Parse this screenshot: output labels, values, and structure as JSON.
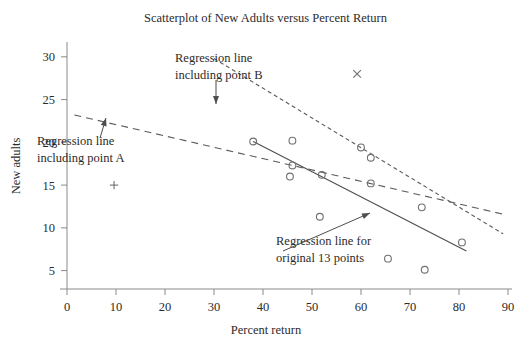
{
  "chart_data": {
    "type": "scatter",
    "title": "Scatterplot of New Adults versus Percent Return",
    "xlabel": "Percent return",
    "ylabel": "New adults",
    "xlim": [
      0,
      90
    ],
    "ylim": [
      3.2,
      31.5
    ],
    "xticks": [
      0,
      10,
      20,
      30,
      40,
      50,
      60,
      70,
      80,
      90
    ],
    "yticks": [
      5,
      10,
      15,
      20,
      25,
      30
    ],
    "grid": false,
    "legend": "none",
    "points": [
      {
        "x": 38,
        "y": 20.1,
        "marker": "circle",
        "label": ""
      },
      {
        "x": 46,
        "y": 20.2,
        "marker": "circle",
        "label": ""
      },
      {
        "x": 46,
        "y": 17.3,
        "marker": "circle",
        "label": ""
      },
      {
        "x": 45.5,
        "y": 16.0,
        "marker": "circle",
        "label": ""
      },
      {
        "x": 52,
        "y": 16.2,
        "marker": "circle",
        "label": ""
      },
      {
        "x": 51.6,
        "y": 11.3,
        "marker": "circle",
        "label": ""
      },
      {
        "x": 60,
        "y": 19.4,
        "marker": "circle",
        "label": ""
      },
      {
        "x": 62,
        "y": 18.2,
        "marker": "circle",
        "label": ""
      },
      {
        "x": 62,
        "y": 15.2,
        "marker": "circle",
        "label": ""
      },
      {
        "x": 72.4,
        "y": 12.4,
        "marker": "circle",
        "label": ""
      },
      {
        "x": 80.6,
        "y": 8.3,
        "marker": "circle",
        "label": ""
      },
      {
        "x": 65.5,
        "y": 6.4,
        "marker": "circle",
        "label": ""
      },
      {
        "x": 73.0,
        "y": 5.1,
        "marker": "circle",
        "label": ""
      },
      {
        "x": 9.6,
        "y": 15.0,
        "marker": "plus",
        "label": "A"
      },
      {
        "x": 59.2,
        "y": 28.0,
        "marker": "cross",
        "label": "B"
      }
    ],
    "lines": [
      {
        "name": "Regression line for original 13 points",
        "style": "solid",
        "x1": 38.0,
        "y1": 20.1,
        "x2": 81.5,
        "y2": 7.3
      },
      {
        "name": "Regression line including point A",
        "style": "long-dash",
        "x1": 1.5,
        "y1": 23.2,
        "x2": 89.0,
        "y2": 11.6
      },
      {
        "name": "Regression line including point B",
        "style": "short-dash",
        "x1": 30.0,
        "y1": 29.8,
        "x2": 89.0,
        "y2": 9.3
      }
    ],
    "annotations": [
      {
        "id": "annot-b",
        "line1": "Regression line",
        "line2": "including point B",
        "text_x": 175,
        "text_y": 62,
        "arrow_from_x": 216,
        "arrow_from_y": 80,
        "arrow_to_x": 216,
        "arrow_to_y": 104
      },
      {
        "id": "annot-a",
        "line1": "Regression line",
        "line2": "including point A",
        "text_x": 37,
        "text_y": 145,
        "arrow_from_x": 100,
        "arrow_from_y": 138,
        "arrow_to_x": 106,
        "arrow_to_y": 118
      },
      {
        "id": "annot-original",
        "line1": "Regression line for",
        "line2": "original 13 points",
        "text_x": 276,
        "text_y": 245,
        "arrow_from_x": 283,
        "arrow_from_y": 251,
        "arrow_to_x": 370,
        "arrow_to_y": 213
      }
    ]
  }
}
